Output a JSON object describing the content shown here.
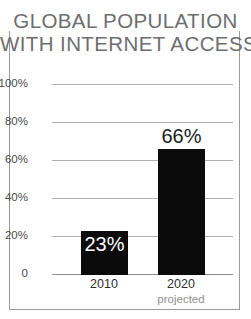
{
  "title": {
    "line1": "GLOBAL POPULATION",
    "line2": "WITH INTERNET ACCESS"
  },
  "colors": {
    "bar": "#0b0b0b",
    "title_text": "#6d6e70",
    "axis_text": "#4b4b4b",
    "gridline": "#b0b0b0",
    "frame": "#9a9a9a",
    "sublabel_text": "#8e8e90",
    "inside_label_text": "#ffffff",
    "outside_label_text": "#1b1b1b",
    "background": "#ffffff"
  },
  "chart_data": {
    "type": "bar",
    "title": "GLOBAL POPULATION WITH INTERNET ACCESS",
    "xlabel": "",
    "ylabel": "",
    "ylim": [
      0,
      100
    ],
    "yticks": [
      0,
      20,
      40,
      60,
      80,
      100
    ],
    "ytick_labels": [
      "0",
      "20%",
      "40%",
      "60%",
      "80%",
      "100%"
    ],
    "grid": true,
    "legend": false,
    "categories": [
      "2010",
      "2020"
    ],
    "category_sublabels": [
      "",
      "projected"
    ],
    "values": [
      23,
      66
    ],
    "data_labels": [
      "23%",
      "66%"
    ],
    "units": "percent"
  },
  "y_axis": {
    "ticks": [
      {
        "label": "100%",
        "value": 100
      },
      {
        "label": "80%",
        "value": 80
      },
      {
        "label": "60%",
        "value": 60
      },
      {
        "label": "40%",
        "value": 40
      },
      {
        "label": "20%",
        "value": 20
      },
      {
        "label": "0",
        "value": 0
      }
    ]
  },
  "bars": [
    {
      "category": "2010",
      "sublabel": "",
      "value": 23,
      "data_label": "23%"
    },
    {
      "category": "2020",
      "sublabel": "projected",
      "value": 66,
      "data_label": "66%"
    }
  ]
}
